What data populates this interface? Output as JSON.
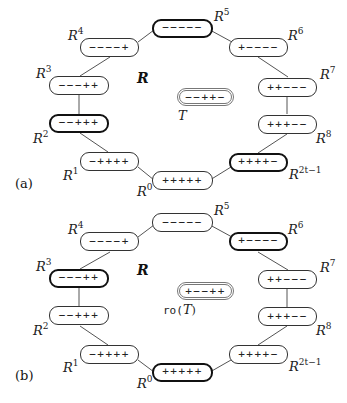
{
  "panels": [
    {
      "id": "a",
      "label": "(a)",
      "set_label": "R",
      "target": {
        "label_base": "T",
        "label_prefix": "",
        "label_suffix": "",
        "signs": "−−++−"
      },
      "nodes": [
        {
          "name": "R5",
          "base": "R",
          "exp": "5",
          "signs": "−−−−−",
          "highlighted": true
        },
        {
          "name": "R4",
          "base": "R",
          "exp": "4",
          "signs": "−−−−+",
          "highlighted": false
        },
        {
          "name": "R6",
          "base": "R",
          "exp": "6",
          "signs": "+−−−−",
          "highlighted": false
        },
        {
          "name": "R3",
          "base": "R",
          "exp": "3",
          "signs": "−−−++",
          "highlighted": false
        },
        {
          "name": "R7",
          "base": "R",
          "exp": "7",
          "signs": "++−−−",
          "highlighted": false
        },
        {
          "name": "R2",
          "base": "R",
          "exp": "2",
          "signs": "−−+++",
          "highlighted": true
        },
        {
          "name": "R8",
          "base": "R",
          "exp": "8",
          "signs": "+++−−",
          "highlighted": false
        },
        {
          "name": "R1",
          "base": "R",
          "exp": "1",
          "signs": "−++++",
          "highlighted": false
        },
        {
          "name": "R2t-1",
          "base": "R",
          "exp": "2t−1",
          "signs": "++++−",
          "highlighted": true
        },
        {
          "name": "R0",
          "base": "R",
          "exp": "0",
          "signs": "+++++",
          "highlighted": false
        }
      ]
    },
    {
      "id": "b",
      "label": "(b)",
      "set_label": "R",
      "target": {
        "label_base": "T",
        "label_prefix": "ro(",
        "label_suffix": ")",
        "signs": "+−−++"
      },
      "nodes": [
        {
          "name": "R5",
          "base": "R",
          "exp": "5",
          "signs": "−−−−−",
          "highlighted": false
        },
        {
          "name": "R4",
          "base": "R",
          "exp": "4",
          "signs": "−−−−+",
          "highlighted": false
        },
        {
          "name": "R6",
          "base": "R",
          "exp": "6",
          "signs": "+−−−−",
          "highlighted": true
        },
        {
          "name": "R3",
          "base": "R",
          "exp": "3",
          "signs": "−−−++",
          "highlighted": true
        },
        {
          "name": "R7",
          "base": "R",
          "exp": "7",
          "signs": "++−−−",
          "highlighted": false
        },
        {
          "name": "R2",
          "base": "R",
          "exp": "2",
          "signs": "−−+++",
          "highlighted": false
        },
        {
          "name": "R8",
          "base": "R",
          "exp": "8",
          "signs": "+++−−",
          "highlighted": false
        },
        {
          "name": "R1",
          "base": "R",
          "exp": "1",
          "signs": "−++++",
          "highlighted": false
        },
        {
          "name": "R2t-1",
          "base": "R",
          "exp": "2t−1",
          "signs": "++++−",
          "highlighted": false
        },
        {
          "name": "R0",
          "base": "R",
          "exp": "0",
          "signs": "+++++",
          "highlighted": true
        }
      ]
    }
  ],
  "colors": {
    "line": "#555555",
    "box_border": "#333333",
    "highlight_border": "#111111",
    "target_border": "#777777"
  }
}
